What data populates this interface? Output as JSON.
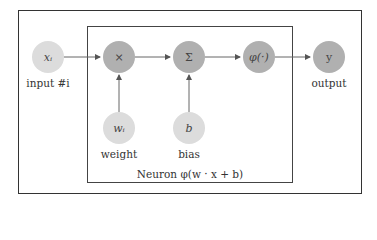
{
  "diagram": {
    "nodes": [
      {
        "id": "input",
        "symbol": "xᵢ",
        "label": "input #i",
        "shade": "light"
      },
      {
        "id": "multiply",
        "symbol": "×",
        "label": "",
        "shade": "dark"
      },
      {
        "id": "sum",
        "symbol": "Σ",
        "label": "",
        "shade": "dark"
      },
      {
        "id": "activation",
        "symbol": "φ(·)",
        "label": "",
        "shade": "dark"
      },
      {
        "id": "output",
        "symbol": "y",
        "label": "output",
        "shade": "dark"
      },
      {
        "id": "weight",
        "symbol": "wᵢ",
        "label": "weight",
        "shade": "light"
      },
      {
        "id": "bias",
        "symbol": "b",
        "label": "bias",
        "shade": "light"
      }
    ],
    "edges": [
      {
        "from": "input",
        "to": "multiply"
      },
      {
        "from": "multiply",
        "to": "sum"
      },
      {
        "from": "sum",
        "to": "activation"
      },
      {
        "from": "activation",
        "to": "output"
      },
      {
        "from": "weight",
        "to": "multiply"
      },
      {
        "from": "bias",
        "to": "sum"
      }
    ],
    "inner_box_caption": "Neuron φ(w · x + b)",
    "colors": {
      "light_node": "#dcdcdc",
      "dark_node": "#b0b0b0",
      "stroke": "#333333"
    }
  }
}
